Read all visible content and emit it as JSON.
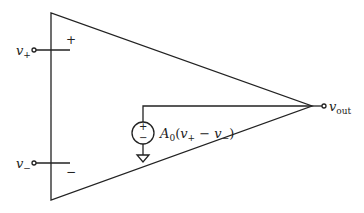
{
  "diagram": {
    "type": "op-amp model",
    "inputs": {
      "plus": {
        "label": "v",
        "subscript": "+",
        "terminal_sign": "+"
      },
      "minus": {
        "label": "v",
        "subscript": "−",
        "terminal_sign": "−"
      }
    },
    "output": {
      "label": "v",
      "subscript": "out"
    },
    "source": {
      "symbol_plus": "+",
      "symbol_minus": "−",
      "expression": "A₀(v₊ − v₋)",
      "gain_label": "A",
      "gain_subscript": "0",
      "paren_open": "(",
      "v1": "v",
      "v1_sub": "+",
      "op": " − ",
      "v2": "v",
      "v2_sub": "−",
      "paren_close": ")"
    },
    "ground": "ground-symbol"
  }
}
